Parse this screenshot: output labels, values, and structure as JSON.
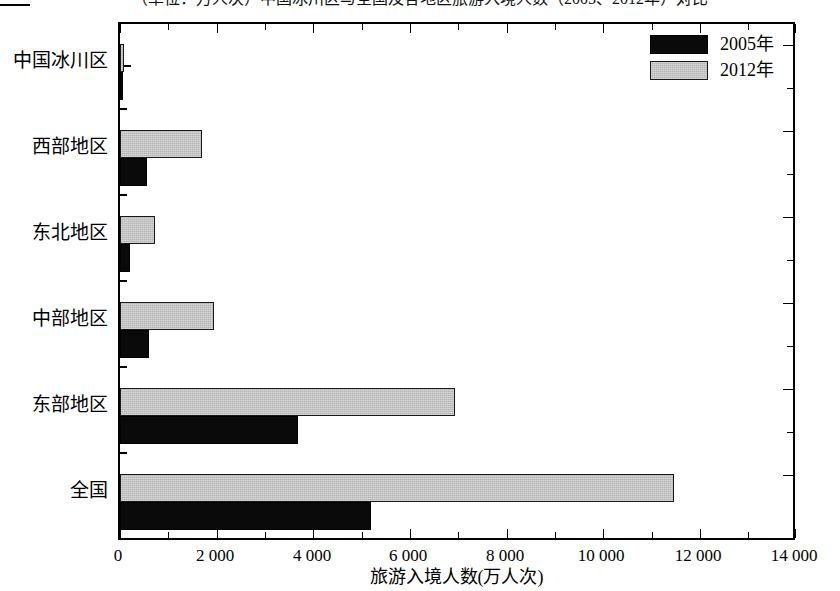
{
  "figure": {
    "title_clipped": "（单位：万人次）中国冰川区与全国及各地区旅游入境人数（2005、2012年）对比",
    "colors": {
      "series_2005": "#0a0a0a",
      "series_2012": "#b6b6b6",
      "axis": "#000000",
      "background": "#ffffff"
    }
  },
  "legend": {
    "position": "top-right",
    "entries": [
      {
        "label": "2005年",
        "swatch": "black-swatch"
      },
      {
        "label": "2012年",
        "swatch": "gray-swatch"
      }
    ]
  },
  "chart_data": {
    "type": "bar",
    "orientation": "horizontal",
    "title": "",
    "xlabel": "旅游入境人数(万人次)",
    "ylabel": "",
    "categories": [
      "中国冰川区",
      "西部地区",
      "东北地区",
      "中部地区",
      "东部地区",
      "全国"
    ],
    "series": [
      {
        "name": "2005年",
        "values": [
          60,
          570,
          200,
          600,
          3700,
          5200
        ]
      },
      {
        "name": "2012年",
        "values": [
          80,
          1700,
          730,
          1950,
          6950,
          11500
        ]
      }
    ],
    "xlim": [
      0,
      14000
    ],
    "xticks": [
      0,
      2000,
      4000,
      6000,
      8000,
      10000,
      12000,
      14000
    ],
    "xtick_labels": [
      "0",
      "2 000",
      "4 000",
      "6 000",
      "8 000",
      "10 000",
      "12 000",
      "14 000"
    ],
    "xminor_step": 1000,
    "grid": false,
    "legend_position": "upper right"
  }
}
